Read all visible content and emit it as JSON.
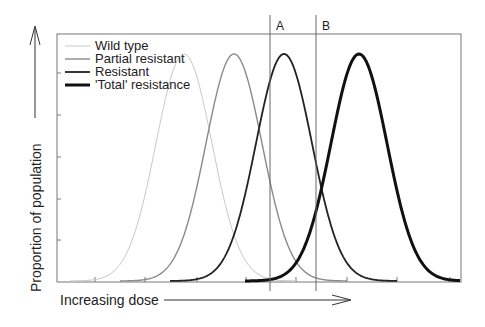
{
  "chart_data": {
    "type": "line",
    "title": "",
    "xlabel": "Increasing dose",
    "ylabel": "Proportion of population",
    "grid": false,
    "legend_position": "upper-left",
    "x_range_px": [
      57,
      461
    ],
    "series": [
      {
        "name": "Wild type",
        "color": "#c8c8c8",
        "width": 1,
        "peak_x_px": 184,
        "start_x_px": 70,
        "end_x_px": 296
      },
      {
        "name": "Partial resistant",
        "color": "#8a8a8a",
        "width": 1.4,
        "peak_x_px": 234,
        "start_x_px": 120,
        "end_x_px": 347
      },
      {
        "name": "Resistant",
        "color": "#222222",
        "width": 1.8,
        "peak_x_px": 284,
        "start_x_px": 170,
        "end_x_px": 397
      },
      {
        "name": "'Total' resistance",
        "color": "#111111",
        "width": 3,
        "peak_x_px": 359,
        "start_x_px": 245,
        "end_x_px": 460
      }
    ],
    "annotations": [
      {
        "label": "A",
        "type": "vertical-line",
        "x_px": 270
      },
      {
        "label": "B",
        "type": "vertical-line",
        "x_px": 316
      }
    ],
    "y_ticks_px": [
      73,
      115,
      157,
      199,
      240
    ],
    "x_ticks_px": [
      95,
      145,
      197,
      246,
      296,
      347,
      397,
      450
    ]
  },
  "legend": {
    "items": [
      {
        "label": "Wild type"
      },
      {
        "label": "Partial resistant"
      },
      {
        "label": "Resistant"
      },
      {
        "label": "'Total' resistance"
      }
    ]
  },
  "markers": {
    "a": "A",
    "b": "B"
  },
  "axes": {
    "x_label": "Increasing dose",
    "y_label": "Proportion of population"
  }
}
